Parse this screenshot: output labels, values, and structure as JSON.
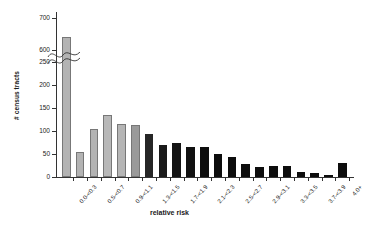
{
  "chart_data": {
    "type": "bar",
    "title": "",
    "xlabel": "relative risk",
    "ylabel": "# census tracts",
    "ylim": [
      0,
      700
    ],
    "grid": false,
    "legend": null,
    "axis_break": {
      "from": 250,
      "to": 600,
      "note": "y-axis break drawn as squiggle across first bar"
    },
    "y_ticks": [
      0,
      50,
      100,
      150,
      200,
      250,
      600,
      700
    ],
    "categories": [
      "0.0-<0.3",
      "0.3-<0.5",
      "0.5-<0.7",
      "0.7-<0.9",
      "0.9-<1.1",
      "1.1-<1.3",
      "1.3-<1.5",
      "1.5-<1.7",
      "1.7-<1.9",
      "1.9-<2.1",
      "2.1-<2.3",
      "2.3-<2.5",
      "2.5-<2.7",
      "2.7-<2.9",
      "2.9-<3.1",
      "3.1-<3.3",
      "3.3-<3.5",
      "3.5-<3.7",
      "3.7-<3.9",
      "3.9-<4.0",
      "4.0+"
    ],
    "visible_tick_labels": [
      "0.0-<0.3",
      "0.5-<0.7",
      "0.9-<1.1",
      "1.3-<1.5",
      "1.7-<1.9",
      "2.1-<2.3",
      "2.5-<2.7",
      "2.9-<3.1",
      "3.3-<3.5",
      "3.7-<3.9",
      "4.0+"
    ],
    "values": [
      640,
      55,
      105,
      135,
      115,
      112,
      94,
      70,
      73,
      65,
      66,
      50,
      43,
      28,
      21,
      24,
      25,
      11,
      9,
      3,
      30
    ],
    "bar_colors": [
      "#b3b3b3",
      "#b3b3b3",
      "#b3b3b3",
      "#b8b8b8",
      "#b5b5b5",
      "#9a9a9a",
      "#262626",
      "#1a1a1a",
      "#141414",
      "#111111",
      "#0d0d0d",
      "#0d0d0d",
      "#0d0d0d",
      "#0d0d0d",
      "#0d0d0d",
      "#0d0d0d",
      "#0d0d0d",
      "#0d0d0d",
      "#0d0d0d",
      "#0d0d0d",
      "#0d0d0d"
    ]
  },
  "axis": {
    "y_title": "# census tracts",
    "x_title": "relative risk"
  }
}
